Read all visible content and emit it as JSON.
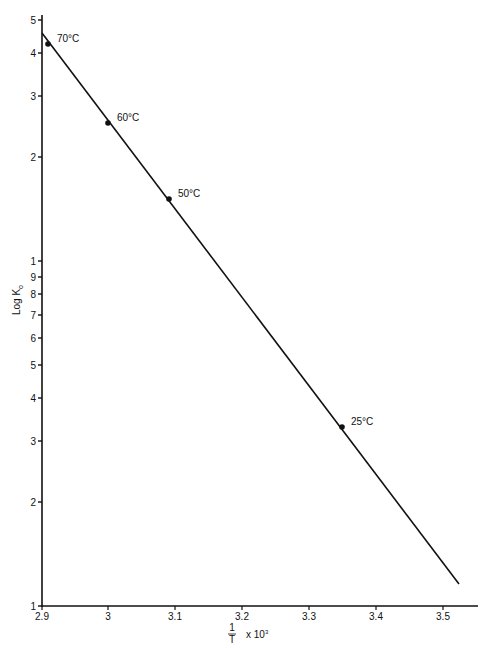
{
  "chart_data": {
    "type": "line",
    "title": "",
    "xlabel": "1/T x 10^3",
    "xlabel_parts": {
      "numerator": "1",
      "denominator": "T",
      "multiplier": "x 10",
      "exponent": "3"
    },
    "ylabel": "Log K",
    "ylabel_parts": {
      "main": "Log K",
      "subscript": "o"
    },
    "y_scale": "log",
    "xlim": [
      2.9,
      3.55
    ],
    "ylim": [
      1,
      50
    ],
    "grid": false,
    "legend": "none",
    "x_ticks": [
      {
        "value": 2.9,
        "label": "2.9",
        "px": 42
      },
      {
        "value": 3.0,
        "label": "3",
        "px": 108
      },
      {
        "value": 3.1,
        "label": "3.1",
        "px": 175
      },
      {
        "value": 3.2,
        "label": "3.2",
        "px": 242
      },
      {
        "value": 3.3,
        "label": "3.3",
        "px": 309
      },
      {
        "value": 3.4,
        "label": "3.4",
        "px": 376
      },
      {
        "value": 3.5,
        "label": "3.5",
        "px": 443
      }
    ],
    "y_ticks": [
      {
        "value": 1,
        "label": "1",
        "px": 606
      },
      {
        "value": 2,
        "label": "2",
        "px": 502
      },
      {
        "value": 3,
        "label": "3",
        "px": 441
      },
      {
        "value": 4,
        "label": "4",
        "px": 398
      },
      {
        "value": 5,
        "label": "5",
        "px": 365
      },
      {
        "value": 6,
        "label": "6",
        "px": 338
      },
      {
        "value": 7,
        "label": "7",
        "px": 315
      },
      {
        "value": 8,
        "label": "8",
        "px": 294
      },
      {
        "value": 9,
        "label": "9",
        "px": 277
      },
      {
        "value": 10,
        "label": "1",
        "px": 261
      },
      {
        "value": 20,
        "label": "2",
        "px": 157
      },
      {
        "value": 30,
        "label": "3",
        "px": 96
      },
      {
        "value": 40,
        "label": "4",
        "px": 53
      },
      {
        "value": 50,
        "label": "5",
        "px": 20
      }
    ],
    "points": [
      {
        "label": "70°C",
        "x": 2.91,
        "y": 42.5,
        "px": 48,
        "py": 44
      },
      {
        "label": "60°C",
        "x": 3.0,
        "y": 25.1,
        "px": 108,
        "py": 123
      },
      {
        "label": "50°C",
        "x": 3.09,
        "y": 15.1,
        "px": 169,
        "py": 199
      },
      {
        "label": "25°C",
        "x": 3.355,
        "y": 3.3,
        "px": 342,
        "py": 427
      }
    ],
    "fit_line": {
      "start": {
        "x": 2.9,
        "y": 46,
        "px": 42,
        "py": 33
      },
      "end": {
        "x": 3.525,
        "y": 1.15,
        "px": 459,
        "py": 584
      }
    },
    "series": [
      {
        "name": "Log Ko vs 1/T",
        "x": [
          2.91,
          3.0,
          3.09,
          3.355
        ],
        "values": [
          42.5,
          25.1,
          15.1,
          3.3
        ]
      }
    ]
  }
}
